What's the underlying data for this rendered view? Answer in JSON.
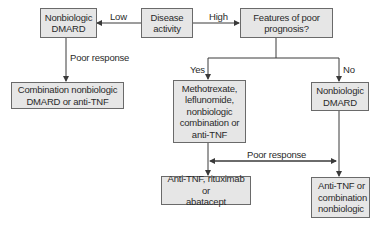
{
  "nodes": {
    "disease_activity": "Disease\nactivity",
    "nonbiologic_dmard_low": "Nonbiologic\nDMARD",
    "features_poor_prognosis": "Features of poor\nprognosis?",
    "combination_or_antitnf": "Combination nonbiologic\nDMARD or anti-TNF",
    "methotrexate_group": "Methotrexate,\nleflunomide,\nnonbiologic\ncombination or\nanti-TNF",
    "nonbiologic_dmard_no": "Nonbiologic\nDMARD",
    "antitnf_rituximab_abatacept": "Anti-TNF, rituximab or\nabatacept",
    "antitnf_or_combination": "Anti-TNF or\ncombination\nnonbiologic"
  },
  "edge_labels": {
    "low": "Low",
    "high": "High",
    "poor_response_left": "Poor response",
    "yes": "Yes",
    "no": "No",
    "poor_response_bottom": "Poor response"
  },
  "colors": {
    "box_fill": "#e6e6e6",
    "box_border": "#6a6a6a",
    "line": "#3a3a3a"
  }
}
